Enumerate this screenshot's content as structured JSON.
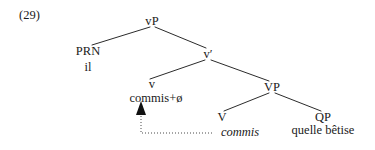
{
  "example": {
    "number_label": "(29)"
  },
  "tree": {
    "nodes": [
      {
        "id": "vP",
        "label": "vP",
        "x": 152,
        "y": 22
      },
      {
        "id": "PRN",
        "label": "PRN",
        "x": 88,
        "y": 52
      },
      {
        "id": "vbar",
        "label": "v′",
        "x": 208,
        "y": 55
      },
      {
        "id": "v",
        "label": "v",
        "x": 152,
        "y": 85
      },
      {
        "id": "VP",
        "label": "VP",
        "x": 272,
        "y": 88
      },
      {
        "id": "V",
        "label": "V",
        "x": 222,
        "y": 118
      },
      {
        "id": "QP",
        "label": "QP",
        "x": 323,
        "y": 118
      }
    ],
    "terminals": [
      {
        "id": "il",
        "label": "il",
        "x": 88,
        "y": 67
      },
      {
        "id": "commis-zero",
        "label": "commis+ø",
        "x": 156,
        "y": 99
      },
      {
        "id": "quelle-betise",
        "label": "quelle bêtise",
        "x": 323,
        "y": 131
      }
    ],
    "trace": {
      "label": "commis",
      "x": 240,
      "y": 128
    },
    "branches": [
      {
        "from": "vP",
        "to": "PRN",
        "x1": 150,
        "y1": 27,
        "x2": 92,
        "y2": 45
      },
      {
        "from": "vP",
        "to": "vbar",
        "x1": 155,
        "y1": 27,
        "x2": 206,
        "y2": 48
      },
      {
        "from": "vbar",
        "to": "v",
        "x1": 205,
        "y1": 60,
        "x2": 150,
        "y2": 79
      },
      {
        "from": "vbar",
        "to": "VP",
        "x1": 211,
        "y1": 60,
        "x2": 269,
        "y2": 81
      },
      {
        "from": "VP",
        "to": "V",
        "x1": 269,
        "y1": 93,
        "x2": 224,
        "y2": 111
      },
      {
        "from": "VP",
        "to": "QP",
        "x1": 275,
        "y1": 93,
        "x2": 321,
        "y2": 111
      }
    ],
    "movement_arrow": {
      "name": "head-movement-arrow",
      "path": "M 212 133 L 141 133 L 141 112",
      "arrowhead_tip": {
        "x": 141,
        "y": 103
      }
    },
    "style": {
      "line_color": "#2b2b2b",
      "line_width": 1,
      "arrow_color": "#3a3a3a",
      "arrow_dash": "1,2",
      "background": "#ffffff"
    }
  }
}
